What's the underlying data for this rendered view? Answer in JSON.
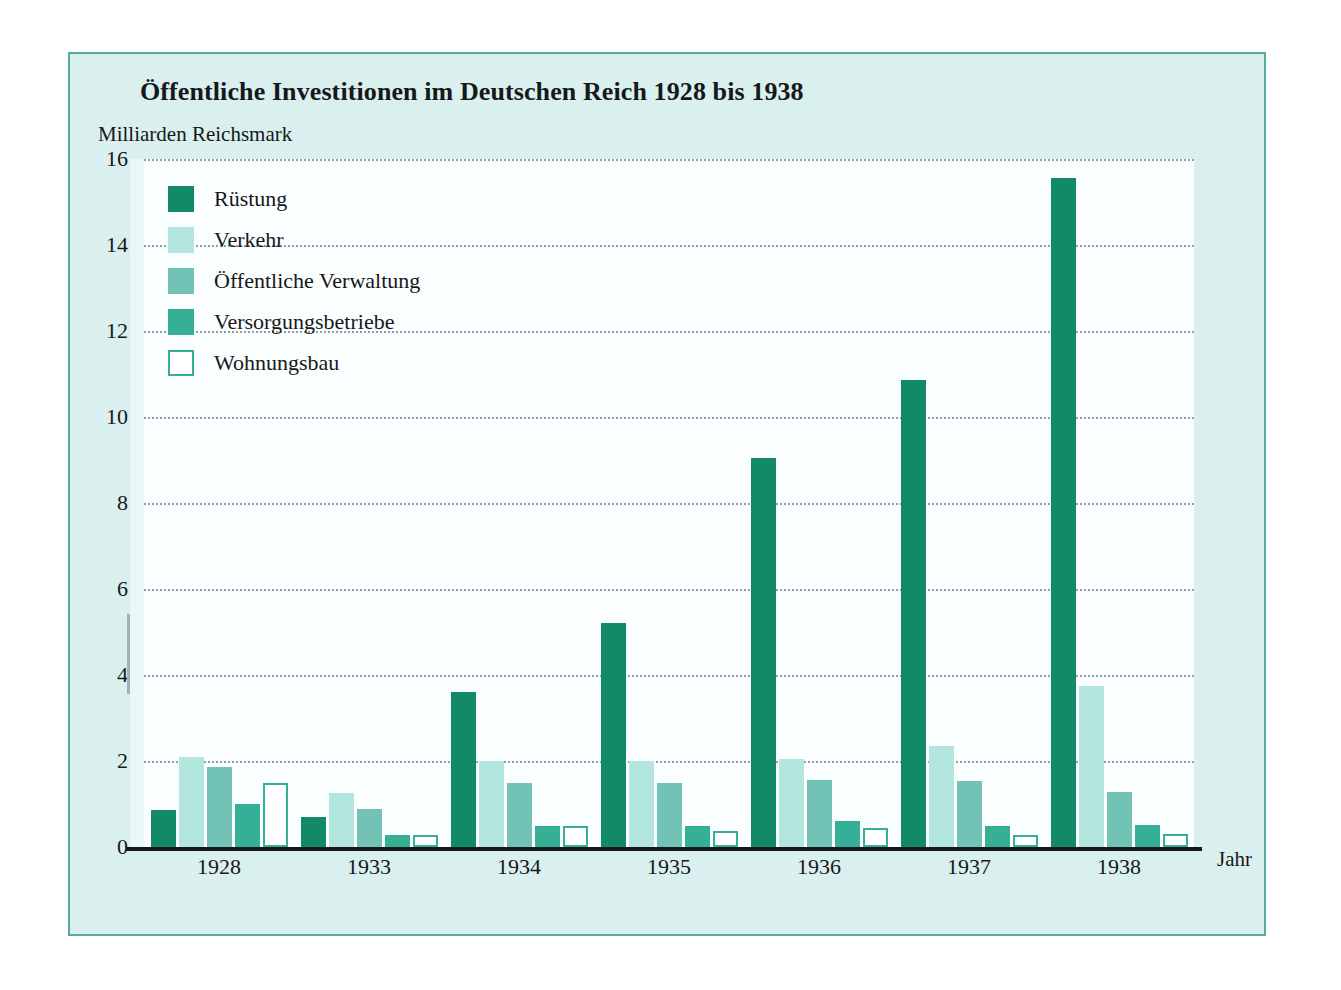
{
  "chart_data": {
    "type": "bar",
    "title": "Öffentliche Investitionen im Deutschen Reich 1928 bis 1938",
    "ylabel": "Milliarden Reichsmark",
    "xlabel": "Jahr",
    "ylim": [
      0,
      16
    ],
    "yticks": [
      0,
      2,
      4,
      6,
      8,
      10,
      12,
      14,
      16
    ],
    "grid": true,
    "legend_position": "top-left",
    "categories": [
      "1928",
      "1933",
      "1934",
      "1935",
      "1936",
      "1937",
      "1938"
    ],
    "series": [
      {
        "name": "Rüstung",
        "color": "#128a68",
        "border": "#128a68",
        "values": [
          0.85,
          0.7,
          3.6,
          5.2,
          9.05,
          10.85,
          15.55
        ]
      },
      {
        "name": "Verkehr",
        "color": "#b4e6e0",
        "border": "#b4e6e0",
        "values": [
          2.1,
          1.25,
          2.0,
          2.0,
          2.05,
          2.35,
          3.75
        ]
      },
      {
        "name": "Öffentliche Verwaltung",
        "color": "#72c3b5",
        "border": "#72c3b5",
        "values": [
          1.85,
          0.88,
          1.5,
          1.5,
          1.55,
          1.53,
          1.28
        ]
      },
      {
        "name": "Versorgungsbetriebe",
        "color": "#35b096",
        "border": "#35b096",
        "values": [
          1.0,
          0.27,
          0.5,
          0.48,
          0.6,
          0.5,
          0.52
        ]
      },
      {
        "name": "Wohnungsbau",
        "color": "#ffffff",
        "border": "#35b096",
        "values": [
          1.48,
          0.27,
          0.48,
          0.38,
          0.45,
          0.27,
          0.3
        ]
      }
    ]
  },
  "colors": {
    "frame_border": "#56a9a0",
    "frame_background": "#daf0ee",
    "plot_background": "#fbfefe",
    "gridline": "#7d8f96",
    "axis": "#14181b",
    "text": "#16181a"
  }
}
